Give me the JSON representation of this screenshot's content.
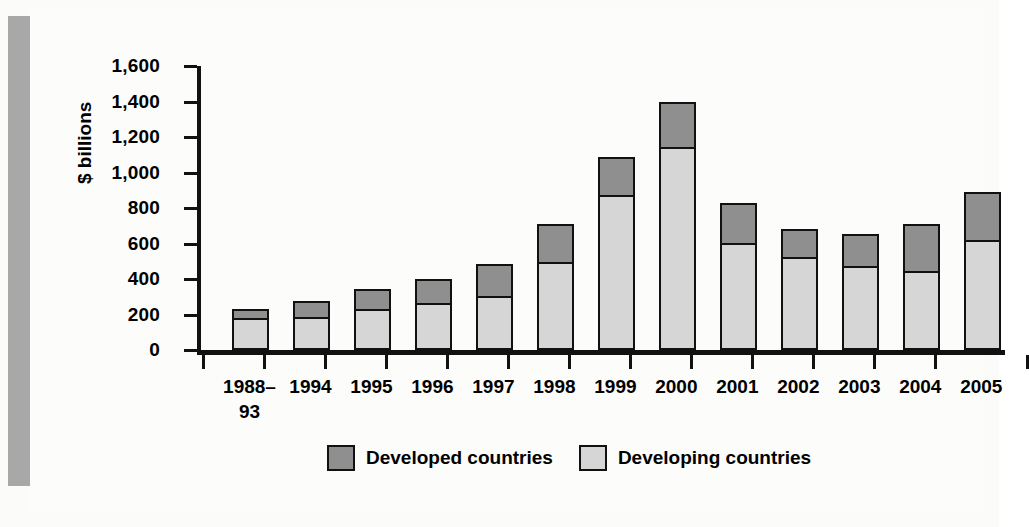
{
  "chart_data": {
    "type": "bar",
    "stacked": true,
    "title": "",
    "xlabel": "",
    "ylabel": "$ billions",
    "ylim": [
      0,
      1600
    ],
    "yticks": [
      0,
      200,
      400,
      600,
      800,
      1000,
      1200,
      1400,
      1600
    ],
    "ytick_labels": [
      "0",
      "200",
      "400",
      "600",
      "800",
      "1,000",
      "1,200",
      "1,400",
      "1,600"
    ],
    "grid": false,
    "legend_position": "bottom-center",
    "categories": [
      "1988–\n93",
      "1994",
      "1995",
      "1996",
      "1997",
      "1998",
      "1999",
      "2000",
      "2001",
      "2002",
      "2003",
      "2004",
      "2005"
    ],
    "series": [
      {
        "name": "Developing countries",
        "color": "#d6d6d6",
        "values": [
          155,
          165,
          210,
          240,
          280,
          475,
          850,
          1120,
          580,
          500,
          450,
          420,
          600
        ]
      },
      {
        "name": "Developed countries",
        "color": "#8f8f8f",
        "values": [
          55,
          90,
          110,
          135,
          180,
          210,
          215,
          255,
          225,
          160,
          180,
          265,
          265
        ]
      }
    ],
    "totals": [
      210,
      255,
      320,
      375,
      460,
      685,
      1065,
      1375,
      805,
      660,
      630,
      685,
      865
    ]
  },
  "legend": {
    "items": [
      {
        "label": "Developed countries",
        "swatch": "developed"
      },
      {
        "label": "Developing countries",
        "swatch": "developing"
      }
    ]
  }
}
